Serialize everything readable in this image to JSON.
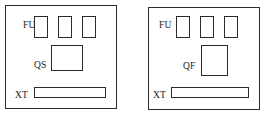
{
  "diagram": {
    "stroke_color": "#2b2b2b",
    "background_color": "#ffffff",
    "panels": [
      {
        "id": "left",
        "name": "panel-left",
        "frame": {
          "x": 5,
          "y": 5,
          "width": 112,
          "height": 104
        },
        "fuse_group": {
          "label": "FU",
          "label_x": 22,
          "label_y": 20,
          "count": 3,
          "items": [
            {
              "x": 33,
              "y": 15,
              "width": 14,
              "height": 22
            },
            {
              "x": 57,
              "y": 15,
              "width": 14,
              "height": 22
            },
            {
              "x": 81,
              "y": 15,
              "width": 14,
              "height": 22
            }
          ]
        },
        "device": {
          "label": "QS",
          "label_x": 33,
          "label_y": 60,
          "box": {
            "x": 50,
            "y": 44,
            "width": 32,
            "height": 26
          }
        },
        "terminal": {
          "label": "XT",
          "label_x": 14,
          "label_y": 90,
          "bar": {
            "x": 33,
            "y": 86,
            "width": 72,
            "height": 11
          }
        }
      },
      {
        "id": "right",
        "name": "panel-right",
        "frame": {
          "x": 148,
          "y": 7,
          "width": 112,
          "height": 103
        },
        "fuse_group": {
          "label": "FU",
          "label_x": 160,
          "label_y": 20,
          "count": 3,
          "items": [
            {
              "x": 175,
              "y": 15,
              "width": 14,
              "height": 22
            },
            {
              "x": 199,
              "y": 15,
              "width": 14,
              "height": 22
            },
            {
              "x": 223,
              "y": 15,
              "width": 14,
              "height": 22
            }
          ]
        },
        "device": {
          "label": "QF",
          "label_x": 182,
          "label_y": 61,
          "box": {
            "x": 200,
            "y": 44,
            "width": 27,
            "height": 31
          }
        },
        "terminal": {
          "label": "XT",
          "label_x": 152,
          "label_y": 90,
          "bar": {
            "x": 170,
            "y": 86,
            "width": 78,
            "height": 11
          }
        }
      }
    ]
  }
}
